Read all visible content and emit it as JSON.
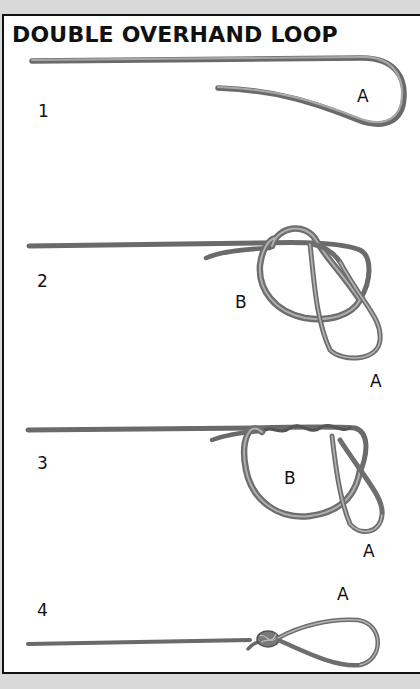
{
  "title": "DOUBLE OVERHAND LOOP",
  "steps": [
    {
      "number": "1",
      "labels": [
        "A"
      ]
    },
    {
      "number": "2",
      "labels": [
        "B",
        "A"
      ]
    },
    {
      "number": "3",
      "labels": [
        "B",
        "A"
      ]
    },
    {
      "number": "4",
      "labels": [
        "A"
      ]
    }
  ],
  "colors": {
    "rope": "#8a8a8a",
    "rope_highlight": "#bdbdbd",
    "rope_shadow": "#5e5e5e",
    "border": "#111111",
    "background": "#ffffff",
    "outer_background": "#d9d9d9"
  }
}
